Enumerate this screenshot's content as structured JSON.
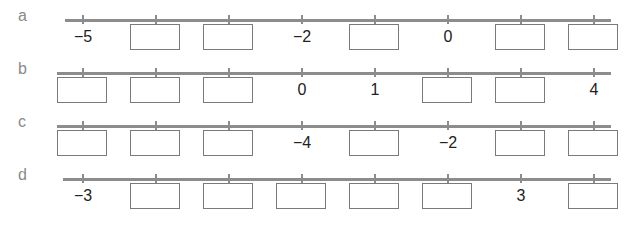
{
  "number_lines": [
    {
      "label": "a",
      "cells": [
        {
          "type": "value",
          "text": "−5"
        },
        {
          "type": "blank"
        },
        {
          "type": "blank"
        },
        {
          "type": "value",
          "text": "−2"
        },
        {
          "type": "blank"
        },
        {
          "type": "value",
          "text": "0"
        },
        {
          "type": "blank"
        },
        {
          "type": "blank"
        }
      ]
    },
    {
      "label": "b",
      "cells": [
        {
          "type": "blank"
        },
        {
          "type": "blank"
        },
        {
          "type": "blank"
        },
        {
          "type": "value",
          "text": "0"
        },
        {
          "type": "value",
          "text": "1"
        },
        {
          "type": "blank"
        },
        {
          "type": "blank"
        },
        {
          "type": "value",
          "text": "4"
        }
      ]
    },
    {
      "label": "c",
      "cells": [
        {
          "type": "blank"
        },
        {
          "type": "blank"
        },
        {
          "type": "blank"
        },
        {
          "type": "value",
          "text": "−4"
        },
        {
          "type": "blank"
        },
        {
          "type": "value",
          "text": "−2"
        },
        {
          "type": "blank"
        },
        {
          "type": "blank"
        }
      ]
    },
    {
      "label": "d",
      "cells": [
        {
          "type": "value",
          "text": "−3"
        },
        {
          "type": "blank"
        },
        {
          "type": "blank"
        },
        {
          "type": "blank"
        },
        {
          "type": "blank"
        },
        {
          "type": "blank"
        },
        {
          "type": "value",
          "text": "3"
        },
        {
          "type": "blank"
        }
      ]
    }
  ]
}
